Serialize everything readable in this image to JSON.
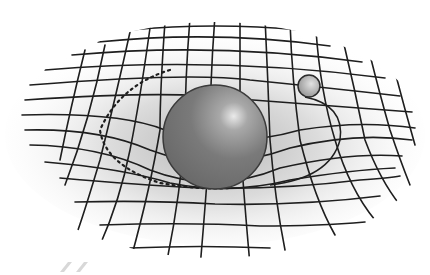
{
  "figure": {
    "elements": {
      "grid": "warped-coordinate-grid",
      "large_mass": "large-sphere",
      "small_mass": "small-orbiting-sphere",
      "orbit": "orbit-path"
    },
    "colors": {
      "background": "#ffffff",
      "grid_line": "#1e1e1e",
      "grid_shade": "#d8d8d8",
      "large_sphere": "#7a7a7a",
      "large_sphere_highlight": "#e6e6e6",
      "small_sphere": "#9a9a9a",
      "small_sphere_highlight": "#e0e0e0"
    },
    "large_sphere": {
      "cx": 215,
      "cy": 137,
      "r": 52
    },
    "small_sphere": {
      "cx": 309,
      "cy": 86,
      "r": 11
    }
  }
}
